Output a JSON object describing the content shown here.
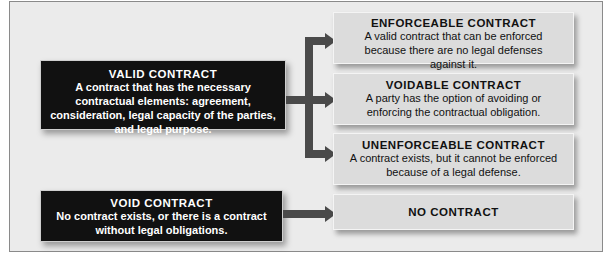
{
  "diagram": {
    "valid": {
      "title": "VALID CONTRACT",
      "description": "A contract that has the necessary contractual elements: agreement, consideration, legal capacity of the parties, and legal purpose."
    },
    "void": {
      "title": "VOID CONTRACT",
      "description": "No contract exists, or there is a contract without legal obligations."
    },
    "outcomes": [
      {
        "title": "ENFORCEABLE CONTRACT",
        "description": "A valid contract that can be enforced because there are no legal defenses against it."
      },
      {
        "title": "VOIDABLE CONTRACT",
        "description": "A party has the option of avoiding or enforcing the contractual obligation."
      },
      {
        "title": "UNENFORCEABLE CONTRACT",
        "description": "A contract exists, but it cannot be enforced because of a legal defense."
      },
      {
        "title": "NO CONTRACT",
        "description": ""
      }
    ],
    "colors": {
      "dark_box": "#111111",
      "light_box": "#dcdcdc",
      "connector": "#4a4a4a",
      "background": "#ebebeb"
    }
  }
}
